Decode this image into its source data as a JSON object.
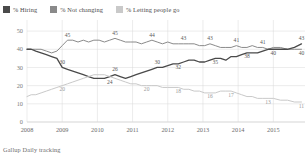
{
  "legend": {
    "items": [
      {
        "label": "% Hiring",
        "color": "#4a4a4a",
        "key": "hiring"
      },
      {
        "label": "% Not changing",
        "color": "#8a8a8a",
        "key": "not_changing"
      },
      {
        "label": "% Letting people go",
        "color": "#c9c9c9",
        "key": "letting_go"
      }
    ]
  },
  "footer": {
    "source": "Gallup Daily tracking"
  },
  "chart_data": {
    "type": "line",
    "title": "",
    "subtitle": "",
    "xlabel": "",
    "ylabel": "",
    "ylim": [
      0,
      55
    ],
    "yticks": [
      0,
      10,
      20,
      30,
      40,
      50
    ],
    "ytick_labels": [
      "0",
      "10",
      "20",
      "30",
      "40",
      "50"
    ],
    "xlim": [
      2008,
      2015.9
    ],
    "xticks": [
      2008,
      2009,
      2010,
      2011,
      2012,
      2013,
      2014,
      2015
    ],
    "xtick_labels": [
      "2008",
      "2009",
      "2010",
      "2011",
      "2012",
      "2013",
      "2014",
      "2015"
    ],
    "grid": true,
    "legend_position": "top-left",
    "series": [
      {
        "name": "% Not changing",
        "color": "#8a8a8a",
        "width": 1.0,
        "x": [
          2008.0,
          2008.12,
          2008.25,
          2008.4,
          2008.55,
          2008.7,
          2008.85,
          2009.0,
          2009.15,
          2009.3,
          2009.45,
          2009.6,
          2009.75,
          2009.9,
          2010.05,
          2010.2,
          2010.35,
          2010.5,
          2010.65,
          2010.8,
          2010.95,
          2011.1,
          2011.25,
          2011.4,
          2011.55,
          2011.7,
          2011.85,
          2012.0,
          2012.15,
          2012.3,
          2012.45,
          2012.6,
          2012.75,
          2012.9,
          2013.05,
          2013.2,
          2013.35,
          2013.5,
          2013.65,
          2013.8,
          2013.95,
          2014.1,
          2014.25,
          2014.4,
          2014.55,
          2014.7,
          2014.85,
          2015.0,
          2015.2,
          2015.4,
          2015.6,
          2015.8
        ],
        "values": [
          40,
          40,
          40,
          40,
          39,
          38,
          39,
          42,
          45,
          45,
          44,
          45,
          44,
          45,
          45,
          44,
          45,
          46,
          45,
          44,
          44,
          44,
          43,
          44,
          45,
          44,
          43,
          44,
          43,
          43,
          43,
          43,
          43,
          42,
          42,
          43,
          42,
          41,
          41,
          41,
          42,
          41,
          41,
          42,
          41,
          41,
          40,
          41,
          41,
          40,
          40,
          40
        ]
      },
      {
        "name": "% Hiring",
        "color": "#4a4a4a",
        "width": 1.3,
        "x": [
          2008.0,
          2008.12,
          2008.25,
          2008.4,
          2008.55,
          2008.7,
          2008.85,
          2009.0,
          2009.15,
          2009.3,
          2009.45,
          2009.6,
          2009.75,
          2009.9,
          2010.05,
          2010.2,
          2010.35,
          2010.5,
          2010.65,
          2010.8,
          2010.95,
          2011.1,
          2011.25,
          2011.4,
          2011.55,
          2011.7,
          2011.85,
          2012.0,
          2012.15,
          2012.3,
          2012.45,
          2012.6,
          2012.75,
          2012.9,
          2013.05,
          2013.2,
          2013.35,
          2013.5,
          2013.65,
          2013.8,
          2013.95,
          2014.1,
          2014.25,
          2014.4,
          2014.55,
          2014.7,
          2014.85,
          2015.0,
          2015.2,
          2015.4,
          2015.6,
          2015.8
        ],
        "values": [
          40,
          40,
          39,
          38,
          37,
          36,
          35,
          30,
          29,
          28,
          27,
          26,
          25,
          24,
          24,
          24,
          25,
          26,
          25,
          24,
          25,
          26,
          27,
          28,
          29,
          30,
          30,
          31,
          32,
          32,
          33,
          34,
          34,
          33,
          33,
          34,
          35,
          35,
          34,
          36,
          36,
          37,
          38,
          38,
          38,
          39,
          40,
          40,
          40,
          40,
          41,
          43
        ]
      },
      {
        "name": "% Letting people go",
        "color": "#c9c9c9",
        "width": 1.0,
        "x": [
          2008.0,
          2008.12,
          2008.25,
          2008.4,
          2008.55,
          2008.7,
          2008.85,
          2009.0,
          2009.15,
          2009.3,
          2009.45,
          2009.6,
          2009.75,
          2009.9,
          2010.05,
          2010.2,
          2010.35,
          2010.5,
          2010.65,
          2010.8,
          2010.95,
          2011.1,
          2011.25,
          2011.4,
          2011.55,
          2011.7,
          2011.85,
          2012.0,
          2012.15,
          2012.3,
          2012.45,
          2012.6,
          2012.75,
          2012.9,
          2013.05,
          2013.2,
          2013.35,
          2013.5,
          2013.65,
          2013.8,
          2013.95,
          2014.1,
          2014.25,
          2014.4,
          2014.55,
          2014.7,
          2014.85,
          2015.0,
          2015.2,
          2015.4,
          2015.6,
          2015.8
        ],
        "values": [
          14,
          15,
          15,
          16,
          17,
          18,
          19,
          20,
          21,
          22,
          23,
          24,
          25,
          26,
          26,
          26,
          25,
          24,
          23,
          22,
          21,
          21,
          20,
          20,
          20,
          20,
          19,
          19,
          19,
          19,
          18,
          18,
          17,
          17,
          16,
          16,
          16,
          17,
          17,
          17,
          16,
          15,
          14,
          14,
          13,
          13,
          13,
          13,
          12,
          12,
          11,
          11
        ]
      }
    ],
    "annotations": [
      {
        "text": "45",
        "x": 2009.15,
        "y": 45,
        "series": "not_changing",
        "dy": -3.5
      },
      {
        "text": "45",
        "x": 2010.5,
        "y": 46,
        "series": "not_changing",
        "dy": -3.5
      },
      {
        "text": "44",
        "x": 2011.55,
        "y": 45,
        "series": "not_changing",
        "dy": -3.5
      },
      {
        "text": "43",
        "x": 2012.45,
        "y": 43,
        "series": "not_changing",
        "dy": -3.5
      },
      {
        "text": "43",
        "x": 2013.2,
        "y": 43,
        "series": "not_changing",
        "dy": -3.5
      },
      {
        "text": "41",
        "x": 2013.95,
        "y": 42,
        "series": "not_changing",
        "dy": -3.5
      },
      {
        "text": "41",
        "x": 2014.7,
        "y": 41,
        "series": "not_changing",
        "dy": -3.5
      },
      {
        "text": "43",
        "x": 2015.8,
        "y": 43,
        "series": "hiring",
        "dy": -3.5
      },
      {
        "text": "30",
        "x": 2009.0,
        "y": 30,
        "series": "hiring",
        "dy": -3.5
      },
      {
        "text": "26",
        "x": 2010.5,
        "y": 26,
        "series": "hiring",
        "dy": -3.5
      },
      {
        "text": "24",
        "x": 2010.35,
        "y": 24,
        "series": "hiring",
        "dy": 5.5
      },
      {
        "text": "30",
        "x": 2011.7,
        "y": 30,
        "series": "hiring",
        "dy": -3.5
      },
      {
        "text": "32",
        "x": 2012.3,
        "y": 32,
        "series": "hiring",
        "dy": 5.5
      },
      {
        "text": "35",
        "x": 2013.35,
        "y": 35,
        "series": "hiring",
        "dy": 5.5
      },
      {
        "text": "38",
        "x": 2014.25,
        "y": 38,
        "series": "hiring",
        "dy": 5.5
      },
      {
        "text": "40",
        "x": 2015.0,
        "y": 40,
        "series": "not_changing",
        "dy": 5.5
      },
      {
        "text": "40",
        "x": 2015.8,
        "y": 40,
        "series": "not_changing",
        "dy": 5.5
      },
      {
        "text": "20",
        "x": 2009.0,
        "y": 20,
        "series": "letting_go",
        "dy": 5.5
      },
      {
        "text": "20",
        "x": 2011.4,
        "y": 20,
        "series": "letting_go",
        "dy": 5.5
      },
      {
        "text": "18",
        "x": 2012.3,
        "y": 19,
        "series": "letting_go",
        "dy": 5.5
      },
      {
        "text": "16",
        "x": 2013.2,
        "y": 16,
        "series": "letting_go",
        "dy": 5.5
      },
      {
        "text": "17",
        "x": 2013.8,
        "y": 17,
        "series": "letting_go",
        "dy": 5.5
      },
      {
        "text": "13",
        "x": 2014.85,
        "y": 13,
        "series": "letting_go",
        "dy": 5.5
      },
      {
        "text": "11",
        "x": 2015.8,
        "y": 11,
        "series": "letting_go",
        "dy": 5.5
      }
    ]
  }
}
